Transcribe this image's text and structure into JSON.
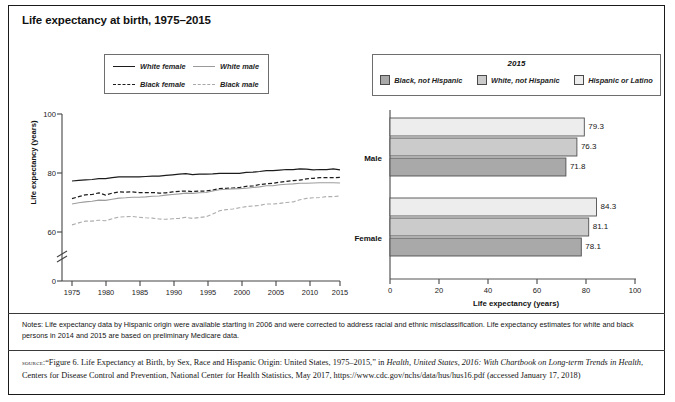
{
  "figure": {
    "title": "Life expectancy at birth, 1975–2015"
  },
  "line_chart": {
    "legend": {
      "items": [
        {
          "label": "White female",
          "style": "solid-dark"
        },
        {
          "label": "White male",
          "style": "solid-light"
        },
        {
          "label": "Black female",
          "style": "dashed-dark"
        },
        {
          "label": "Black male",
          "style": "dashed-light"
        }
      ]
    },
    "ylabel": "Life expectancy (years)",
    "yticks": [
      "100",
      "80",
      "60",
      "0"
    ],
    "xticks": [
      "1975",
      "1980",
      "1985",
      "1990",
      "1995",
      "2000",
      "2005",
      "2010",
      "2015"
    ],
    "axis_break": true
  },
  "bar_chart": {
    "legend": {
      "title": "2015",
      "items": [
        {
          "label": "Black, not Hispanic",
          "color": "#a9a9a9"
        },
        {
          "label": "White, not Hispanic",
          "color": "#cbcbcb"
        },
        {
          "label": "Hispanic or Latino",
          "color": "#ededed"
        }
      ]
    },
    "categories": [
      "Male",
      "Female"
    ],
    "xticks": [
      "0",
      "20",
      "40",
      "60",
      "80",
      "100"
    ],
    "xtitle": "Life expectancy (years)"
  },
  "notes": {
    "text": "Notes: Life expectancy data by Hispanic origin were available starting in 2006 and were corrected to address racial and ethnic misclassification. Life expectancy estimates for white and black persons in 2014 and 2015 are based on preliminary Medicare data."
  },
  "source": {
    "label": "source:",
    "part1": "“Figure 6. Life Expectancy at Birth, by Sex, Race and Hispanic Origin: United States, 1975–2015,” in ",
    "italic1": "Health, United States, 2016: With Chartbook on Long-term Trends in Health",
    "part2": ", Centers for Disease Control and Prevention, National Center for Health Statistics, May 2017, https://www.cdc.gov/nchs/data/hus/hus16.pdf (accessed January 17, 2018)"
  },
  "chart_data": [
    {
      "type": "line",
      "title": "Life expectancy at birth, 1975–2015",
      "xlabel": "",
      "ylabel": "Life expectancy (years)",
      "xlim": [
        1974,
        2016
      ],
      "ylim": [
        55,
        100
      ],
      "yticks": [
        0,
        60,
        80,
        100
      ],
      "axis_break_between": [
        0,
        55
      ],
      "grid": false,
      "legend_position": "top-center",
      "x": [
        1975,
        1976,
        1977,
        1978,
        1979,
        1980,
        1981,
        1982,
        1983,
        1984,
        1985,
        1986,
        1987,
        1988,
        1989,
        1990,
        1991,
        1992,
        1993,
        1994,
        1995,
        1996,
        1997,
        1998,
        1999,
        2000,
        2001,
        2002,
        2003,
        2004,
        2005,
        2006,
        2007,
        2008,
        2009,
        2010,
        2011,
        2012,
        2013,
        2014,
        2015
      ],
      "series": [
        {
          "name": "White female",
          "style": "solid-dark",
          "values": [
            77.3,
            77.5,
            77.7,
            77.8,
            78.1,
            78.1,
            78.4,
            78.7,
            78.7,
            78.7,
            78.7,
            78.8,
            78.9,
            78.9,
            79.2,
            79.4,
            79.6,
            79.8,
            79.5,
            79.6,
            79.6,
            79.7,
            79.9,
            79.9,
            79.9,
            79.9,
            80.2,
            80.3,
            80.5,
            80.8,
            80.8,
            81.0,
            81.2,
            81.2,
            81.4,
            81.3,
            81.1,
            81.2,
            81.2,
            81.4,
            81.1
          ],
          "endpoint": 81.1
        },
        {
          "name": "Black female",
          "style": "dashed-dark",
          "values": [
            71.3,
            72.0,
            72.6,
            72.7,
            73.3,
            72.5,
            73.2,
            73.6,
            73.5,
            73.6,
            73.4,
            73.4,
            73.4,
            73.2,
            73.3,
            73.6,
            73.8,
            73.9,
            73.7,
            73.9,
            73.9,
            74.2,
            74.7,
            74.8,
            74.9,
            75.1,
            75.5,
            75.6,
            76.1,
            76.3,
            76.5,
            76.9,
            77.2,
            77.4,
            77.6,
            78.0,
            78.2,
            78.4,
            78.4,
            78.4,
            78.5
          ],
          "endpoint": 78.5
        },
        {
          "name": "White male",
          "style": "solid-light",
          "values": [
            69.5,
            69.9,
            70.2,
            70.4,
            70.8,
            70.7,
            71.1,
            71.5,
            71.6,
            71.8,
            71.8,
            71.9,
            72.1,
            72.2,
            72.5,
            72.7,
            72.9,
            73.2,
            73.1,
            73.3,
            73.4,
            73.9,
            74.3,
            74.5,
            74.6,
            74.7,
            74.8,
            75.1,
            75.3,
            75.7,
            75.7,
            76.0,
            76.2,
            76.3,
            76.5,
            76.5,
            76.6,
            76.7,
            76.7,
            76.7,
            76.6
          ],
          "endpoint": 76.6
        },
        {
          "name": "Black male",
          "style": "dashed-light",
          "values": [
            62.4,
            63.1,
            63.7,
            63.7,
            64.0,
            63.8,
            64.5,
            65.1,
            65.2,
            65.3,
            65.0,
            64.8,
            64.7,
            64.4,
            64.3,
            64.5,
            64.6,
            65.0,
            64.6,
            64.9,
            65.2,
            66.1,
            67.2,
            67.6,
            67.8,
            68.2,
            68.6,
            68.8,
            69.0,
            69.5,
            69.5,
            69.7,
            70.0,
            70.2,
            70.9,
            71.4,
            71.6,
            71.7,
            72.0,
            72.0,
            72.2
          ],
          "endpoint": 72.2
        }
      ]
    },
    {
      "type": "bar",
      "orientation": "horizontal",
      "title": "2015",
      "xlabel": "Life expectancy (years)",
      "ylabel": "",
      "xlim": [
        0,
        100
      ],
      "xticks": [
        0,
        20,
        40,
        60,
        80,
        100
      ],
      "grid": false,
      "legend_position": "top",
      "categories": [
        "Male",
        "Female"
      ],
      "series": [
        {
          "name": "Hispanic or Latino",
          "color": "#ededed",
          "values": [
            79.3,
            84.3
          ]
        },
        {
          "name": "White, not Hispanic",
          "color": "#cbcbcb",
          "values": [
            76.3,
            81.1
          ]
        },
        {
          "name": "Black, not Hispanic",
          "color": "#a9a9a9",
          "values": [
            71.8,
            78.1
          ]
        }
      ],
      "data_labels": [
        "79.3",
        "76.3",
        "71.8",
        "84.3",
        "81.1",
        "78.1"
      ]
    }
  ]
}
